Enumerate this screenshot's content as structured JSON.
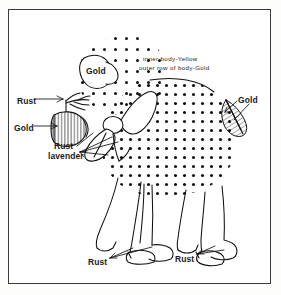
{
  "document": {
    "title": "Lamb craft pattern colour guide",
    "subject": "sheep-line-drawing",
    "frame_color": "#3a3a3a",
    "ink_color": "#111111",
    "background_color": "#ffffff"
  },
  "notes": {
    "line1": "inner body-Yellow",
    "line2": "outer row of body-Gold"
  },
  "labels": {
    "gold_bow": "Gold",
    "rust_ear": "Rust",
    "gold_head": "Gold",
    "rust_neck": "Rust",
    "lavender_neck": "lavender",
    "gold_tail": "Gold",
    "rust_front_leg": "Rust",
    "rust_rear_leg": "Rust"
  },
  "parts": {
    "body": "fleece-dotted-body",
    "head": "hatched-head",
    "ear": "ear-tuft",
    "bow_back": "back-bow-oval",
    "bow_neck": "neck-bow",
    "tail": "hatched-tail-cone",
    "front_legs": "front-legs",
    "rear_legs": "rear-legs",
    "hooves": "hooves"
  },
  "colors": {
    "gold": "#d4a017",
    "yellow": "#f2d541",
    "rust": "#b04a24",
    "lavender": "#b9a6d4"
  }
}
